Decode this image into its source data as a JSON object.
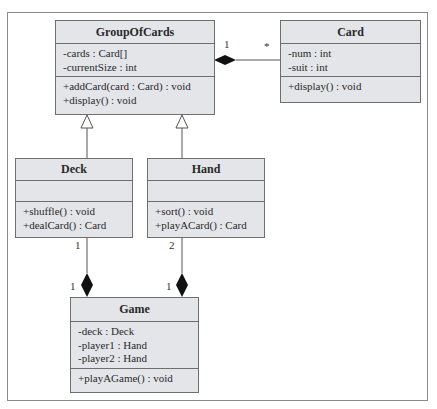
{
  "diagram": {
    "type": "UML class diagram",
    "classes": {
      "groupOfCards": {
        "name": "GroupOfCards",
        "attributes": [
          "-cards : Card[]",
          "-currentSize : int"
        ],
        "methods": [
          "+addCard(card : Card) : void",
          "+display() : void"
        ]
      },
      "card": {
        "name": "Card",
        "attributes": [
          "-num : int",
          "-suit : int"
        ],
        "methods": [
          "+display() : void"
        ]
      },
      "deck": {
        "name": "Deck",
        "attributes": [],
        "methods": [
          "+shuffle() : void",
          "+dealCard() : Card"
        ]
      },
      "hand": {
        "name": "Hand",
        "attributes": [],
        "methods": [
          "+sort() : void",
          "+playACard() : Card"
        ]
      },
      "game": {
        "name": "Game",
        "attributes": [
          "-deck : Deck",
          "-player1 : Hand",
          "-player2 : Hand"
        ],
        "methods": [
          "+playAGame() : void"
        ]
      }
    },
    "relationships": [
      {
        "type": "composition",
        "whole": "GroupOfCards",
        "part": "Card",
        "whole_mult": "1",
        "part_mult": "*"
      },
      {
        "type": "generalization",
        "child": "Deck",
        "parent": "GroupOfCards"
      },
      {
        "type": "generalization",
        "child": "Hand",
        "parent": "GroupOfCards"
      },
      {
        "type": "composition",
        "whole": "Game",
        "part": "Deck",
        "whole_mult": "1",
        "part_mult": "1"
      },
      {
        "type": "composition",
        "whole": "Game",
        "part": "Hand",
        "whole_mult": "1",
        "part_mult": "2"
      }
    ],
    "multiplicities": {
      "goc_card_whole": "1",
      "goc_card_part": "*",
      "deck_part": "1",
      "game_deck_whole": "1",
      "hand_part": "2",
      "game_hand_whole": "1"
    }
  },
  "colors": {
    "box_fill": "#e3e5e8",
    "box_border": "#6e6e6e",
    "line": "#555555",
    "diamond": "#111111",
    "frame": "#8a8a8a"
  }
}
